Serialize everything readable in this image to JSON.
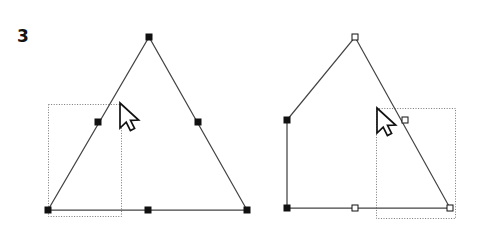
{
  "figure": {
    "step_number": "3",
    "background_color": "#ffffff",
    "stroke_color": "#444444",
    "marker_fill_color": "#111111",
    "marker_hollow_fill": "#ffffff",
    "selection_box_color": "#777777",
    "cursor_outline_color": "#111111",
    "cursor_fill_color": "#ffffff",
    "width": 481,
    "height": 238
  },
  "panels": [
    {
      "name": "before-panel",
      "shape_name": "triangle-original",
      "path_points": [
        {
          "x": 48,
          "y": 210
        },
        {
          "x": 149,
          "y": 37
        },
        {
          "x": 247,
          "y": 210
        }
      ],
      "closed": true,
      "node_markers": [
        {
          "name": "node-bottom-left",
          "x": 48,
          "y": 210,
          "style": "filled"
        },
        {
          "name": "node-apex",
          "x": 149,
          "y": 37,
          "style": "filled"
        },
        {
          "name": "node-bottom-right",
          "x": 247,
          "y": 210,
          "style": "filled"
        }
      ],
      "midpoint_markers": [
        {
          "name": "midpoint-left-edge",
          "x": 98,
          "y": 122,
          "style": "filled"
        },
        {
          "name": "midpoint-right-edge",
          "x": 198,
          "y": 122,
          "style": "filled"
        },
        {
          "name": "midpoint-bottom-edge",
          "x": 148,
          "y": 210,
          "style": "filled"
        }
      ],
      "selection_box": {
        "name": "selection-marquee-left",
        "x": 48,
        "y": 104,
        "width": 73,
        "height": 112
      },
      "cursor": {
        "name": "mouse-cursor-left",
        "x": 120,
        "y": 103
      }
    },
    {
      "name": "after-panel",
      "shape_name": "triangle-deformed",
      "path_points": [
        {
          "x": 287,
          "y": 208
        },
        {
          "x": 287,
          "y": 120
        },
        {
          "x": 355,
          "y": 37
        },
        {
          "x": 450,
          "y": 208
        }
      ],
      "closed": true,
      "node_markers": [
        {
          "name": "node-bottom-left",
          "x": 287,
          "y": 208,
          "style": "filled"
        },
        {
          "name": "node-left-upper",
          "x": 287,
          "y": 120,
          "style": "filled"
        },
        {
          "name": "node-apex",
          "x": 355,
          "y": 37,
          "style": "hollow"
        },
        {
          "name": "node-bottom-right",
          "x": 450,
          "y": 208,
          "style": "hollow"
        }
      ],
      "midpoint_markers": [
        {
          "name": "midpoint-right-edge",
          "x": 405,
          "y": 120,
          "style": "hollow"
        },
        {
          "name": "midpoint-bottom-edge",
          "x": 355,
          "y": 208,
          "style": "hollow"
        }
      ],
      "selection_box": {
        "name": "selection-marquee-right",
        "x": 376,
        "y": 108,
        "width": 79,
        "height": 110
      },
      "cursor": {
        "name": "mouse-cursor-right",
        "x": 377,
        "y": 108
      }
    }
  ]
}
